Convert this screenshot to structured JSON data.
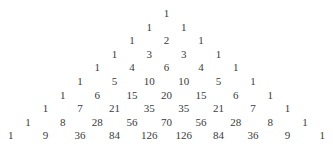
{
  "layout": {
    "center_x": 166.5,
    "top_y": 13,
    "row_spacing": 13.6,
    "half_step": 17.3
  },
  "rows": [
    [
      1
    ],
    [
      1,
      1
    ],
    [
      1,
      2,
      1
    ],
    [
      1,
      3,
      3,
      1
    ],
    [
      1,
      4,
      6,
      4,
      1
    ],
    [
      1,
      5,
      10,
      10,
      5,
      1
    ],
    [
      1,
      6,
      15,
      20,
      15,
      6,
      1
    ],
    [
      1,
      7,
      21,
      35,
      35,
      21,
      7,
      1
    ],
    [
      1,
      8,
      28,
      56,
      70,
      56,
      28,
      8,
      1
    ],
    [
      1,
      9,
      36,
      84,
      126,
      126,
      84,
      36,
      9,
      1
    ]
  ]
}
